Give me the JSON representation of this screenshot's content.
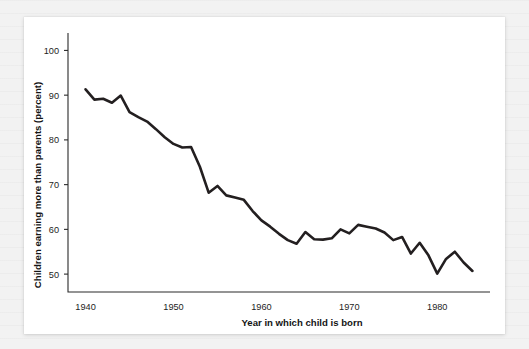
{
  "figure": {
    "background_color": "#f2f2f2",
    "card_color": "#ffffff",
    "line_color": "#231f20",
    "axis_color": "#2b2b2b"
  },
  "axis_titles": {
    "x": "Year in which child is born",
    "y": "Children earning more than parents (percent)"
  },
  "ticks": {
    "y": [
      "50",
      "60",
      "70",
      "80",
      "90",
      "100"
    ],
    "x": [
      "1940",
      "1950",
      "1960",
      "1970",
      "1980"
    ]
  },
  "chart_data": {
    "type": "line",
    "title": "",
    "subtitle": "",
    "xlabel": "Year in which child is born",
    "ylabel": "Children earning more than parents (percent)",
    "xlim": [
      1938,
      1986
    ],
    "ylim": [
      46,
      103
    ],
    "xticks": [
      1940,
      1950,
      1960,
      1970,
      1980
    ],
    "yticks": [
      50,
      60,
      70,
      80,
      90,
      100
    ],
    "grid": false,
    "legend": "none",
    "series": [
      {
        "name": "Children earning more than parents (percent)",
        "color": "#231f20",
        "x": [
          1940,
          1941,
          1942,
          1943,
          1944,
          1945,
          1946,
          1947,
          1948,
          1949,
          1950,
          1951,
          1952,
          1953,
          1954,
          1955,
          1956,
          1957,
          1958,
          1959,
          1960,
          1961,
          1962,
          1963,
          1964,
          1965,
          1966,
          1967,
          1968,
          1969,
          1970,
          1971,
          1972,
          1973,
          1974,
          1975,
          1976,
          1977,
          1978,
          1979,
          1980,
          1981,
          1982,
          1983,
          1984
        ],
        "y": [
          91.3,
          89.0,
          89.2,
          88.3,
          89.9,
          86.2,
          85.1,
          84.1,
          82.4,
          80.6,
          79.1,
          78.3,
          78.4,
          74.0,
          68.2,
          69.7,
          67.6,
          67.1,
          66.6,
          64.1,
          62.0,
          60.6,
          59.0,
          57.6,
          56.8,
          59.4,
          57.8,
          57.7,
          58.0,
          60.0,
          59.1,
          61.0,
          60.6,
          60.2,
          59.3,
          57.6,
          58.3,
          54.6,
          57.0,
          54.2,
          50.1,
          53.4,
          55.0,
          52.6,
          50.7
        ]
      }
    ]
  }
}
